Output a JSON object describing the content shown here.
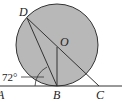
{
  "diagram": {
    "type": "geometry",
    "colors": {
      "circle_fill": "#b8b8b8",
      "stroke": "#333333",
      "background": "#ffffff"
    },
    "labels": {
      "D": "D",
      "O": "O",
      "A": "A",
      "B": "B",
      "C": "C",
      "angle": "72°"
    }
  }
}
